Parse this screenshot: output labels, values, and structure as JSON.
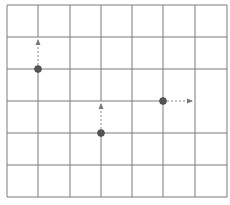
{
  "diagram": {
    "colors": {
      "background": "#ffffff",
      "grid_line": "#7a7a7a",
      "node_fill": "#555555",
      "arrow": "#8a8a8a"
    },
    "grid": {
      "x_lines": [
        7,
        38,
        70,
        101,
        132,
        163,
        195,
        227
      ],
      "y_lines": [
        5,
        37,
        69,
        101,
        133,
        165,
        197
      ]
    },
    "segments": [
      {
        "x1": 7,
        "y1": 5,
        "x2": 227,
        "y2": 5
      },
      {
        "x1": 7,
        "y1": 37,
        "x2": 227,
        "y2": 37
      },
      {
        "x1": 7,
        "y1": 69,
        "x2": 227,
        "y2": 69
      },
      {
        "x1": 7,
        "y1": 101,
        "x2": 163,
        "y2": 101
      },
      {
        "x1": 7,
        "y1": 133,
        "x2": 227,
        "y2": 133
      },
      {
        "x1": 7,
        "y1": 165,
        "x2": 227,
        "y2": 165
      },
      {
        "x1": 7,
        "y1": 197,
        "x2": 227,
        "y2": 197
      },
      {
        "x1": 7,
        "y1": 5,
        "x2": 7,
        "y2": 197
      },
      {
        "x1": 38,
        "y1": 5,
        "x2": 38,
        "y2": 37
      },
      {
        "x1": 38,
        "y1": 69,
        "x2": 38,
        "y2": 197
      },
      {
        "x1": 70,
        "y1": 5,
        "x2": 70,
        "y2": 197
      },
      {
        "x1": 101,
        "y1": 5,
        "x2": 101,
        "y2": 101
      },
      {
        "x1": 101,
        "y1": 133,
        "x2": 101,
        "y2": 197
      },
      {
        "x1": 132,
        "y1": 5,
        "x2": 132,
        "y2": 197
      },
      {
        "x1": 163,
        "y1": 5,
        "x2": 163,
        "y2": 197
      },
      {
        "x1": 195,
        "y1": 5,
        "x2": 195,
        "y2": 197
      },
      {
        "x1": 227,
        "y1": 5,
        "x2": 227,
        "y2": 197
      }
    ],
    "nodes": [
      {
        "id": "node-1",
        "x": 38,
        "y": 69,
        "arrow": {
          "x2": 38,
          "y2": 40,
          "direction": "up"
        }
      },
      {
        "id": "node-2",
        "x": 101,
        "y": 133,
        "arrow": {
          "x2": 101,
          "y2": 104,
          "direction": "up"
        }
      },
      {
        "id": "node-3",
        "x": 163,
        "y": 101,
        "arrow": {
          "x2": 192,
          "y2": 101,
          "direction": "right"
        }
      }
    ],
    "caption": ""
  }
}
